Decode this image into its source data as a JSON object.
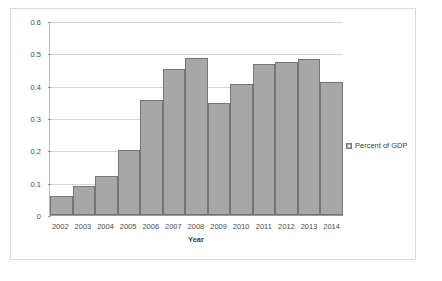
{
  "chart_data": {
    "type": "bar",
    "title": "",
    "xlabel": "Year",
    "ylabel": "",
    "categories": [
      "2002",
      "2003",
      "2004",
      "2005",
      "2006",
      "2007",
      "2008",
      "2009",
      "2010",
      "2011",
      "2012",
      "2013",
      "2014"
    ],
    "values": [
      0.06,
      0.09,
      0.12,
      0.2,
      0.355,
      0.452,
      0.485,
      0.345,
      0.405,
      0.467,
      0.472,
      0.483,
      0.41
    ],
    "series": [
      {
        "name": "Percent of GDP",
        "values": [
          0.06,
          0.09,
          0.12,
          0.2,
          0.355,
          0.452,
          0.485,
          0.345,
          0.405,
          0.467,
          0.472,
          0.483,
          0.41
        ]
      }
    ],
    "ylim": [
      0,
      0.6
    ],
    "y_ticks": [
      0,
      0.1,
      0.2,
      0.3,
      0.4,
      0.5,
      0.6
    ],
    "y_tick_labels": [
      "0",
      "0.1",
      "0.2",
      "0.3",
      "0.4",
      "0.5",
      "0.6"
    ],
    "grid": true,
    "legend": {
      "position": "right",
      "entries": [
        "Percent of GDP"
      ]
    },
    "colors": {
      "bar_fill": "#a7a7a7",
      "bar_border": "#757575",
      "gridline": "#d4d4d4",
      "axis": "#9a9a9a",
      "frame": "#d9d9d9",
      "text": "#4a4a4a"
    }
  },
  "legend": {
    "label": "Percent of GDP",
    "marker": "legend-swatch-icon"
  },
  "axis": {
    "x_title": "Year"
  }
}
